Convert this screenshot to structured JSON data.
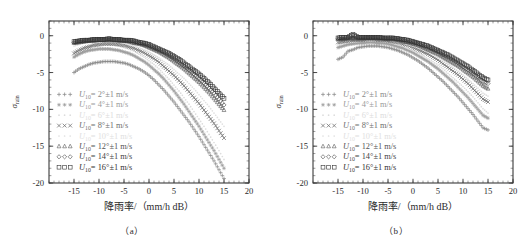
{
  "figure": {
    "panels": [
      {
        "id": "a",
        "caption": "（a）",
        "xlabel": "降雨率/（mm/h dB）",
        "ylabel_main": "σ",
        "ylabel_sub": "rain"
      },
      {
        "id": "b",
        "caption": "（b）",
        "xlabel": "降雨率/（mm/h dB）",
        "ylabel_main": "σ",
        "ylabel_sub": "rain"
      }
    ]
  },
  "axes": {
    "x_ticks": [
      "-15",
      "-10",
      "-5",
      "0",
      "5",
      "10",
      "15",
      "20"
    ],
    "y_ticks": [
      "0",
      "-5",
      "-10",
      "-15",
      "-20"
    ],
    "xlim": [
      -20,
      20
    ],
    "ylim": [
      -20,
      2
    ],
    "x_major_step": 5,
    "x_minor_step": 1,
    "y_major_step": 5,
    "y_minor_step": 1,
    "grid": false,
    "frame": "box",
    "ticks_direction": "in"
  },
  "legend": {
    "position": "lower-left",
    "entries": [
      {
        "marker": "+",
        "label": "U",
        "sub": "10",
        "value": "= 2°±1 m/s",
        "color": "#8a8a8a",
        "faint": false
      },
      {
        "marker": "*",
        "label": "U",
        "sub": "10",
        "value": "= 4°±1 m/s",
        "color": "#9a9a9a",
        "faint": false
      },
      {
        "marker": "·",
        "label": "U",
        "sub": "10",
        "value": "= 6°±1 m/s",
        "color": "#dcdcdc",
        "faint": true
      },
      {
        "marker": "×",
        "label": "U",
        "sub": "10",
        "value": "= 8°±1 m/s",
        "color": "#6e6e6e",
        "faint": false
      },
      {
        "marker": "·",
        "label": "U",
        "sub": "10",
        "value": "= 10°±1 m/s",
        "color": "#e0e0e0",
        "faint": true
      },
      {
        "marker": "△",
        "label": "U",
        "sub": "10",
        "value": "= 12°±1 m/s",
        "color": "#555555",
        "faint": false
      },
      {
        "marker": "◇",
        "label": "U",
        "sub": "10",
        "value": "= 14°±1 m/s",
        "color": "#444444",
        "faint": false
      },
      {
        "marker": "□",
        "label": "U",
        "sub": "10",
        "value": "= 16°±1 m/s",
        "color": "#333333",
        "faint": false
      }
    ]
  },
  "chart_data": {
    "type": "scatter",
    "title": "",
    "xlabel": "降雨率/（mm/h dB）",
    "ylabel": "σ_rain",
    "xlim": [
      -20,
      20
    ],
    "ylim": [
      -20,
      2
    ],
    "xticks": [
      -15,
      -10,
      -5,
      0,
      5,
      10,
      15,
      20
    ],
    "yticks": [
      0,
      -5,
      -10,
      -15,
      -20
    ],
    "grid": false,
    "legend_position": "lower left",
    "panels": [
      {
        "id": "a",
        "caption": "（a）",
        "x": [
          -15,
          -14,
          -13,
          -12,
          -11,
          -10,
          -9,
          -8,
          -7,
          -6,
          -5,
          -4,
          -3,
          -2,
          -1,
          0,
          1,
          2,
          3,
          4,
          5,
          6,
          7,
          8,
          9,
          10,
          11,
          12,
          13,
          14,
          15
        ],
        "series": [
          {
            "name": "U10 = 2°±1 m/s",
            "marker": "+",
            "color": "#8a8a8a",
            "values": [
              -5.0,
              -4.5,
              -4.2,
              -3.9,
              -3.7,
              -3.6,
              -3.5,
              -3.5,
              -3.5,
              -3.6,
              -3.7,
              -3.9,
              -4.2,
              -4.5,
              -4.9,
              -5.4,
              -6.0,
              -6.7,
              -7.4,
              -8.2,
              -9.0,
              -9.9,
              -10.8,
              -11.7,
              -12.7,
              -13.7,
              -14.8,
              -15.9,
              -17.0,
              -18.2,
              -19.4
            ]
          },
          {
            "name": "U10 = 4°±1 m/s",
            "marker": "*",
            "color": "#9a9a9a",
            "values": [
              -2.9,
              -2.5,
              -2.2,
              -2.0,
              -1.9,
              -1.8,
              -1.8,
              -1.8,
              -1.9,
              -2.0,
              -2.2,
              -2.4,
              -2.7,
              -3.1,
              -3.5,
              -4.0,
              -4.6,
              -5.2,
              -5.9,
              -6.7,
              -7.5,
              -8.4,
              -9.3,
              -10.3,
              -11.3,
              -12.3,
              -13.4,
              -14.5,
              -15.6,
              -16.8,
              -18.0
            ]
          },
          {
            "name": "U10 = 6°±1 m/s",
            "marker": "·",
            "color": "#dcdcdc",
            "values": [
              -2.2,
              -1.9,
              -1.6,
              -1.4,
              -1.3,
              -1.2,
              -1.2,
              -1.2,
              -1.3,
              -1.4,
              -1.6,
              -1.8,
              -2.1,
              -2.5,
              -2.9,
              -3.4,
              -3.9,
              -4.5,
              -5.2,
              -5.9,
              -6.7,
              -7.5,
              -8.4,
              -9.3,
              -10.3,
              -11.3,
              -12.3,
              -13.4,
              -14.5,
              -15.6,
              -16.8
            ]
          },
          {
            "name": "U10 = 8°±1 m/s",
            "marker": "×",
            "color": "#6e6e6e",
            "values": [
              -2.4,
              -2.0,
              -1.7,
              -1.5,
              -1.3,
              -1.2,
              -1.1,
              -1.1,
              -1.1,
              -1.2,
              -1.3,
              -1.5,
              -1.7,
              -2.0,
              -2.3,
              -2.7,
              -3.1,
              -3.6,
              -4.2,
              -4.8,
              -5.4,
              -6.1,
              -6.8,
              -7.6,
              -8.4,
              -9.2,
              -10.1,
              -11.0,
              -11.9,
              -12.9,
              -13.9
            ]
          },
          {
            "name": "U10 = 10°±1 m/s",
            "marker": "·",
            "color": "#e0e0e0",
            "values": [
              -1.4,
              -1.2,
              -1.0,
              -0.9,
              -0.8,
              -0.8,
              -0.8,
              -0.8,
              -0.8,
              -0.9,
              -1.0,
              -1.2,
              -1.4,
              -1.6,
              -1.9,
              -2.2,
              -2.6,
              -3.0,
              -3.5,
              -4.0,
              -4.6,
              -5.2,
              -5.8,
              -6.5,
              -7.2,
              -8.0,
              -8.8,
              -9.6,
              -10.5,
              -11.4,
              -12.3
            ]
          },
          {
            "name": "U10 = 12°±1 m/s",
            "marker": "△",
            "color": "#555555",
            "values": [
              -1.0,
              -0.9,
              -0.8,
              -0.7,
              -0.7,
              -0.6,
              -0.6,
              -0.6,
              -0.6,
              -0.7,
              -0.7,
              -0.8,
              -1.0,
              -1.1,
              -1.3,
              -1.6,
              -1.9,
              -2.2,
              -2.6,
              -3.0,
              -3.5,
              -4.0,
              -4.5,
              -5.1,
              -5.7,
              -6.3,
              -7.0,
              -7.7,
              -8.5,
              -9.3,
              -10.1
            ]
          },
          {
            "name": "U10 = 14°±1 m/s",
            "marker": "◇",
            "color": "#444444",
            "values": [
              -0.9,
              -0.8,
              -0.7,
              -0.6,
              -0.6,
              -0.5,
              -0.5,
              -0.5,
              -0.5,
              -0.6,
              -0.6,
              -0.7,
              -0.8,
              -1.0,
              -1.2,
              -1.4,
              -1.7,
              -2.0,
              -2.3,
              -2.7,
              -3.1,
              -3.6,
              -4.1,
              -4.6,
              -5.2,
              -5.8,
              -6.4,
              -7.1,
              -7.8,
              -8.6,
              -9.4
            ]
          },
          {
            "name": "U10 = 16°±1 m/s",
            "marker": "□",
            "color": "#333333",
            "values": [
              -0.8,
              -0.7,
              -0.6,
              -0.6,
              -0.5,
              -0.5,
              -0.5,
              -0.4,
              -0.5,
              -0.5,
              -0.6,
              -0.6,
              -0.7,
              -0.9,
              -1.0,
              -1.2,
              -1.5,
              -1.8,
              -2.1,
              -2.4,
              -2.8,
              -3.2,
              -3.7,
              -4.2,
              -4.7,
              -5.2,
              -5.8,
              -6.4,
              -7.1,
              -7.8,
              -8.5
            ]
          }
        ]
      },
      {
        "id": "b",
        "caption": "（b）",
        "x": [
          -15,
          -14,
          -13,
          -12,
          -11,
          -10,
          -9,
          -8,
          -7,
          -6,
          -5,
          -4,
          -3,
          -2,
          -1,
          0,
          1,
          2,
          3,
          4,
          5,
          6,
          7,
          8,
          9,
          10,
          11,
          12,
          13,
          14,
          15
        ],
        "series": [
          {
            "name": "U10 = 2°±1 m/s",
            "marker": "+",
            "color": "#8a8a8a",
            "values": [
              -3.2,
              -2.9,
              -2.1,
              -1.9,
              -1.6,
              -1.5,
              -1.4,
              -1.4,
              -1.4,
              -1.5,
              -1.6,
              -1.8,
              -2.0,
              -2.3,
              -2.6,
              -3.0,
              -3.4,
              -3.9,
              -4.4,
              -5.0,
              -5.6,
              -6.2,
              -6.9,
              -7.6,
              -8.3,
              -9.1,
              -9.9,
              -10.7,
              -11.6,
              -12.5,
              -12.8
            ]
          },
          {
            "name": "U10 = 4°±1 m/s",
            "marker": "*",
            "color": "#9a9a9a",
            "values": [
              -1.6,
              -1.4,
              -1.2,
              -1.1,
              -1.0,
              -1.0,
              -0.9,
              -0.9,
              -1.0,
              -1.0,
              -1.1,
              -1.3,
              -1.5,
              -1.7,
              -2.0,
              -2.3,
              -2.7,
              -3.1,
              -3.5,
              -4.0,
              -4.5,
              -5.1,
              -5.7,
              -6.3,
              -7.0,
              -7.7,
              -8.4,
              -9.2,
              -10.0,
              -10.8,
              -11.2
            ]
          },
          {
            "name": "U10 = 6°±1 m/s",
            "marker": "·",
            "color": "#dcdcdc",
            "values": [
              -1.2,
              -1.0,
              -0.9,
              -0.8,
              -0.8,
              -0.7,
              -0.7,
              -0.7,
              -0.7,
              -0.8,
              -0.9,
              -1.0,
              -1.2,
              -1.4,
              -1.7,
              -2.0,
              -2.3,
              -2.7,
              -3.1,
              -3.5,
              -4.0,
              -4.5,
              -5.1,
              -5.7,
              -6.3,
              -6.9,
              -7.6,
              -8.3,
              -9.1,
              -9.9,
              -10.5
            ]
          },
          {
            "name": "U10 = 8°±1 m/s",
            "marker": "×",
            "color": "#6e6e6e",
            "values": [
              -0.9,
              -0.8,
              -0.7,
              -0.6,
              -0.6,
              -0.6,
              -0.5,
              -0.5,
              -0.6,
              -0.6,
              -0.7,
              -0.8,
              -0.9,
              -1.1,
              -1.3,
              -1.6,
              -1.9,
              -2.2,
              -2.5,
              -2.9,
              -3.3,
              -3.8,
              -4.3,
              -4.8,
              -5.3,
              -5.9,
              -6.5,
              -7.2,
              -7.9,
              -8.6,
              -9.0
            ]
          },
          {
            "name": "U10 = 10°±1 m/s",
            "marker": "·",
            "color": "#e0e0e0",
            "values": [
              -0.7,
              -0.6,
              -0.6,
              -0.5,
              -0.5,
              -0.5,
              -0.4,
              -0.4,
              -0.5,
              -0.5,
              -0.6,
              -0.7,
              -0.8,
              -1.0,
              -1.2,
              -1.4,
              -1.6,
              -1.9,
              -2.2,
              -2.6,
              -3.0,
              -3.4,
              -3.8,
              -4.3,
              -4.8,
              -5.3,
              -5.9,
              -6.5,
              -7.1,
              -7.8,
              -8.2
            ]
          },
          {
            "name": "U10 = 12°±1 m/s",
            "marker": "△",
            "color": "#555555",
            "values": [
              -0.5,
              -0.5,
              -0.4,
              -0.4,
              -0.4,
              -0.4,
              -0.3,
              -0.3,
              -0.4,
              -0.4,
              -0.5,
              -0.5,
              -0.6,
              -0.8,
              -0.9,
              -1.1,
              -1.3,
              -1.6,
              -1.9,
              -2.2,
              -2.5,
              -2.9,
              -3.3,
              -3.7,
              -4.1,
              -4.6,
              -5.1,
              -5.6,
              -6.2,
              -6.8,
              -7.2
            ]
          },
          {
            "name": "U10 = 14°±1 m/s",
            "marker": "◇",
            "color": "#444444",
            "values": [
              -0.4,
              -0.4,
              -0.3,
              -0.3,
              -0.3,
              -0.3,
              -0.3,
              -0.3,
              -0.3,
              -0.3,
              -0.4,
              -0.4,
              -0.5,
              -0.6,
              -0.8,
              -0.9,
              -1.1,
              -1.4,
              -1.6,
              -1.9,
              -2.2,
              -2.6,
              -2.9,
              -3.3,
              -3.7,
              -4.2,
              -4.6,
              -5.1,
              -5.6,
              -6.2,
              -6.5
            ]
          },
          {
            "name": "U10 = 16°±1 m/s",
            "marker": "□",
            "color": "#333333",
            "values": [
              -0.3,
              -0.2,
              -0.2,
              0.2,
              -0.2,
              -0.2,
              -0.2,
              -0.2,
              -0.2,
              -0.3,
              -0.3,
              -0.3,
              -0.4,
              -0.5,
              -0.6,
              -0.8,
              -1.0,
              -1.2,
              -1.4,
              -1.7,
              -2.0,
              -2.3,
              -2.6,
              -3.0,
              -3.4,
              -3.8,
              -4.2,
              -4.7,
              -5.2,
              -5.7,
              -6.0
            ]
          }
        ]
      }
    ]
  }
}
